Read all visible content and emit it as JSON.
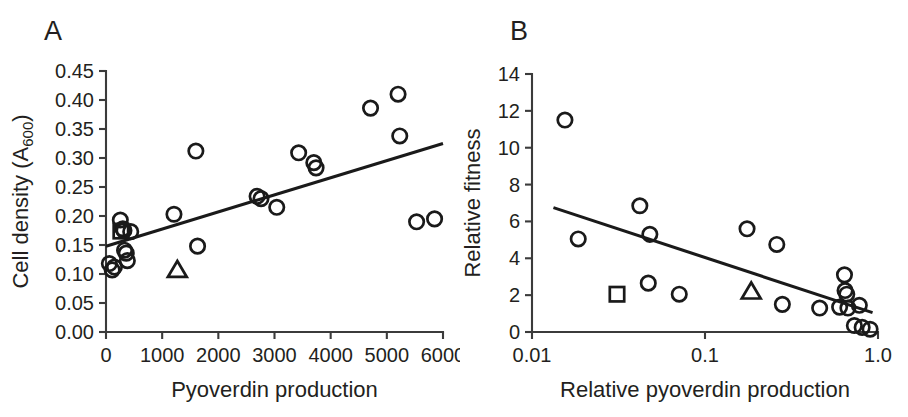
{
  "figure": {
    "background": "#ffffff",
    "marker_color": "#1a1a1a",
    "axis_color": "#3b3b3b",
    "text_color": "#231f20"
  },
  "panels": [
    {
      "letter": "A"
    },
    {
      "letter": "B"
    }
  ],
  "chart_data": [
    {
      "type": "scatter",
      "panel": "A",
      "title": "",
      "xlabel": "Pyoverdin production",
      "ylabel": "Cell density (A600)",
      "ylabel_main": "Cell density (A",
      "ylabel_sub": "600",
      "ylabel_tail": ")",
      "xscale": "linear",
      "yscale": "linear",
      "xlim": [
        0,
        6000
      ],
      "ylim": [
        0.0,
        0.45
      ],
      "xticks": [
        0,
        1000,
        2000,
        3000,
        4000,
        5000,
        6000
      ],
      "xticklabels": [
        "0",
        "1000",
        "2000",
        "3000",
        "4000",
        "5000",
        "6000"
      ],
      "yticks": [
        0.0,
        0.05,
        0.1,
        0.15,
        0.2,
        0.25,
        0.3,
        0.35,
        0.4,
        0.45
      ],
      "yticklabels": [
        "0.00",
        "0.05",
        "0.10",
        "0.15",
        "0.20",
        "0.25",
        "0.30",
        "0.35",
        "0.40",
        "0.45"
      ],
      "grid": false,
      "legend": "none",
      "series": [
        {
          "name": "circles",
          "marker": "circle",
          "points": [
            [
              60,
              0.118
            ],
            [
              110,
              0.107
            ],
            [
              150,
              0.112
            ],
            [
              255,
              0.193
            ],
            [
              300,
              0.178
            ],
            [
              320,
              0.175
            ],
            [
              330,
              0.141
            ],
            [
              360,
              0.136
            ],
            [
              380,
              0.123
            ],
            [
              440,
              0.173
            ],
            [
              1210,
              0.203
            ],
            [
              1600,
              0.312
            ],
            [
              1630,
              0.148
            ],
            [
              2690,
              0.234
            ],
            [
              2760,
              0.23
            ],
            [
              3040,
              0.215
            ],
            [
              3430,
              0.309
            ],
            [
              3700,
              0.292
            ],
            [
              3740,
              0.283
            ],
            [
              4710,
              0.386
            ],
            [
              5200,
              0.41
            ],
            [
              5230,
              0.338
            ],
            [
              5530,
              0.19
            ],
            [
              5850,
              0.195
            ]
          ]
        },
        {
          "name": "square",
          "marker": "square",
          "points": [
            [
              265,
              0.174
            ]
          ]
        },
        {
          "name": "triangle",
          "marker": "triangle",
          "points": [
            [
              1270,
              0.107
            ]
          ]
        }
      ],
      "trendline": {
        "x1": 0,
        "y1": 0.148,
        "x2": 6000,
        "y2": 0.325
      }
    },
    {
      "type": "scatter",
      "panel": "B",
      "title": "",
      "xlabel": "Relative pyoverdin production",
      "ylabel": "Relative fitness",
      "xscale": "log",
      "yscale": "linear",
      "xlim": [
        0.01,
        1.0
      ],
      "ylim": [
        0,
        14
      ],
      "xticks": [
        0.01,
        0.1,
        1.0
      ],
      "xticklabels": [
        "0.01",
        "0.1",
        "1.0"
      ],
      "yticks": [
        0,
        2,
        4,
        6,
        8,
        10,
        12,
        14
      ],
      "yticklabels": [
        "0",
        "2",
        "4",
        "6",
        "8",
        "10",
        "12",
        "14"
      ],
      "grid": false,
      "legend": "none",
      "series": [
        {
          "name": "circles",
          "marker": "circle",
          "points": [
            [
              0.0155,
              11.5
            ],
            [
              0.0185,
              5.05
            ],
            [
              0.042,
              6.85
            ],
            [
              0.048,
              5.3
            ],
            [
              0.047,
              2.65
            ],
            [
              0.071,
              2.05
            ],
            [
              0.175,
              5.6
            ],
            [
              0.26,
              4.75
            ],
            [
              0.28,
              1.5
            ],
            [
              0.46,
              1.3
            ],
            [
              0.6,
              1.35
            ],
            [
              0.64,
              3.1
            ],
            [
              0.645,
              2.25
            ],
            [
              0.66,
              2.05
            ],
            [
              0.67,
              1.3
            ],
            [
              0.73,
              0.35
            ],
            [
              0.78,
              1.45
            ],
            [
              0.81,
              0.25
            ],
            [
              0.9,
              0.15
            ]
          ]
        },
        {
          "name": "square",
          "marker": "square",
          "points": [
            [
              0.031,
              2.05
            ]
          ]
        },
        {
          "name": "triangle",
          "marker": "triangle",
          "points": [
            [
              0.185,
              2.2
            ]
          ]
        }
      ],
      "trendline": {
        "x1": 0.0133,
        "y1": 6.75,
        "x2": 0.93,
        "y2": 1.05
      }
    }
  ]
}
